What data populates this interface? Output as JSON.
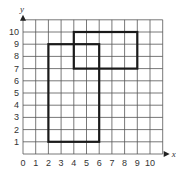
{
  "chart_data": {
    "type": "diagram-on-grid",
    "title": "",
    "xlabel": "x",
    "ylabel": "y",
    "xlim": [
      0,
      11
    ],
    "ylim": [
      0,
      11
    ],
    "x_ticks": [
      "0",
      "1",
      "2",
      "3",
      "4",
      "5",
      "6",
      "7",
      "8",
      "9",
      "10"
    ],
    "y_ticks": [
      "1",
      "2",
      "3",
      "4",
      "5",
      "6",
      "7",
      "8",
      "9",
      "10"
    ],
    "grid": true,
    "shapes": [
      {
        "name": "rectangle-1",
        "type": "rectangle",
        "x1": 2,
        "y1": 1,
        "x2": 6,
        "y2": 9,
        "vertices": [
          [
            2,
            1
          ],
          [
            6,
            1
          ],
          [
            6,
            9
          ],
          [
            2,
            9
          ]
        ]
      },
      {
        "name": "rectangle-2",
        "type": "rectangle",
        "x1": 4,
        "y1": 7,
        "x2": 9,
        "y2": 10,
        "vertices": [
          [
            4,
            7
          ],
          [
            9,
            7
          ],
          [
            9,
            10
          ],
          [
            4,
            10
          ]
        ]
      }
    ]
  },
  "colors": {
    "grid": "#555555",
    "shape_stroke": "#1a1a1a",
    "text": "#333333"
  }
}
